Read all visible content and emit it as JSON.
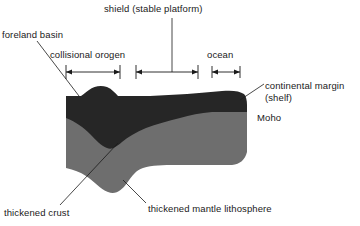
{
  "figure": {
    "background_color": "#ffffff",
    "crust_color": "#262626",
    "mantle_color": "#6e6e6e",
    "line_color": "#1a1a1a"
  },
  "labels": {
    "shield": "shield (stable platform)",
    "foreland_basin": "foreland basin",
    "collisional_orogen": "collisional orogen",
    "ocean": "ocean",
    "continental_margin": "continental margin (shelf)",
    "moho": "Moho",
    "thickened_crust": "thickened crust",
    "thickened_mantle_lithosphere": "thickened mantle lithosphere"
  },
  "spans": [
    {
      "name": "collisional orogen",
      "x_start": 66,
      "x_end": 120,
      "y": 72
    },
    {
      "name": "shield (stable platform)",
      "x_start": 136,
      "x_end": 198,
      "y": 72
    },
    {
      "name": "ocean",
      "x_start": 212,
      "x_end": 240,
      "y": 72
    }
  ],
  "layers": [
    {
      "name": "crust",
      "fill": "#262626",
      "description": "upper dark layer with orogenic topographic bulge and deep crustal root"
    },
    {
      "name": "mantle lithosphere",
      "fill": "#6e6e6e",
      "description": "lower gray layer with thickened keel beneath the orogen"
    }
  ],
  "leaders": [
    {
      "name": "shield-pointer",
      "from": [
        172,
        18
      ],
      "to": [
        172,
        72
      ]
    },
    {
      "name": "foreland-basin-pointer",
      "from": [
        37,
        41
      ],
      "to": [
        79,
        96
      ]
    },
    {
      "name": "continental-margin-pointer",
      "from": [
        264,
        84
      ],
      "to": [
        240,
        100
      ]
    },
    {
      "name": "thickened-crust-pointer",
      "from": [
        60,
        205
      ],
      "to": [
        118,
        143
      ]
    },
    {
      "name": "thickened-mantle-pointer",
      "from": [
        146,
        203
      ],
      "to": [
        123,
        180
      ]
    }
  ]
}
